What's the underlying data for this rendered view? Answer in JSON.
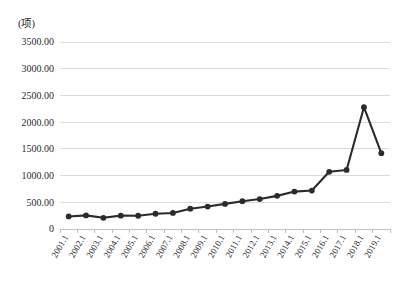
{
  "chart_data": {
    "type": "line",
    "title": "",
    "subtitle": "",
    "unit_label": "(项)",
    "xlabel": "",
    "ylabel": "",
    "ylim": [
      0,
      3500
    ],
    "ytick_labels": [
      "3500.00",
      "3000.00",
      "2500.00",
      "2000.00",
      "1500.00",
      "1000.00",
      "500.00",
      "0"
    ],
    "ytick_values": [
      3500,
      3000,
      2500,
      2000,
      1500,
      1000,
      500,
      0
    ],
    "grid": true,
    "legend": "none",
    "legend_position": "none",
    "marker": "circle",
    "line_color": "#2b2b2b",
    "grid_color": "#d2d2d2",
    "categories": [
      "2001.1",
      "2002.1",
      "2003.1",
      "2004.1",
      "2005.1",
      "2006.1",
      "2007.1",
      "2008.1",
      "2009.1",
      "2010.1",
      "2011.1",
      "2012.1",
      "2013.1",
      "2014.1",
      "2015.1",
      "2016.1",
      "2017.1",
      "2018.1",
      "2019.1"
    ],
    "series": [
      {
        "name": "项目数",
        "values": [
          235,
          255,
          210,
          250,
          248,
          285,
          300,
          380,
          420,
          470,
          520,
          560,
          620,
          700,
          720,
          1070,
          1105,
          2280,
          1420
        ]
      }
    ],
    "values": [
      235,
      255,
      210,
      250,
      248,
      285,
      300,
      380,
      420,
      470,
      520,
      560,
      620,
      700,
      720,
      1070,
      1105,
      2280,
      1420
    ],
    "final_point_value": 3100,
    "note": "last category 2019.1 reaches 3100"
  },
  "layout": {
    "plot_left": 60,
    "plot_right": 390,
    "plot_top": 42,
    "plot_bottom": 229
  }
}
